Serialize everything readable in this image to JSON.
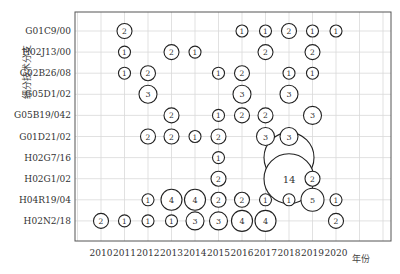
{
  "chart_data": {
    "type": "bubble",
    "title": "",
    "xlabel": "年份",
    "ylabel": "细分技术分支",
    "grid": true,
    "legend": null,
    "x_categories": [
      "2010",
      "2011",
      "2012",
      "2013",
      "2014",
      "2015",
      "2016",
      "2017",
      "2018",
      "2019",
      "2020"
    ],
    "y_categories": [
      "G01C9/00",
      "H02J13/00",
      "G02B26/08",
      "G05D1/02",
      "G05B19/042",
      "G01D21/02",
      "H02G7/16",
      "H02G1/02",
      "H04R19/04",
      "H02N2/18"
    ],
    "points": [
      {
        "row": "G01C9/00",
        "year": "2011",
        "value": 2
      },
      {
        "row": "G01C9/00",
        "year": "2016",
        "value": 1
      },
      {
        "row": "G01C9/00",
        "year": "2017",
        "value": 1
      },
      {
        "row": "G01C9/00",
        "year": "2018",
        "value": 2
      },
      {
        "row": "G01C9/00",
        "year": "2019",
        "value": 1
      },
      {
        "row": "G01C9/00",
        "year": "2020",
        "value": 1
      },
      {
        "row": "H02J13/00",
        "year": "2011",
        "value": 1
      },
      {
        "row": "H02J13/00",
        "year": "2013",
        "value": 2
      },
      {
        "row": "H02J13/00",
        "year": "2014",
        "value": 1
      },
      {
        "row": "H02J13/00",
        "year": "2017",
        "value": 2
      },
      {
        "row": "H02J13/00",
        "year": "2019",
        "value": 2
      },
      {
        "row": "G02B26/08",
        "year": "2011",
        "value": 1
      },
      {
        "row": "G02B26/08",
        "year": "2012",
        "value": 2
      },
      {
        "row": "G02B26/08",
        "year": "2015",
        "value": 1
      },
      {
        "row": "G02B26/08",
        "year": "2016",
        "value": 2
      },
      {
        "row": "G02B26/08",
        "year": "2018",
        "value": 1
      },
      {
        "row": "G02B26/08",
        "year": "2019",
        "value": 1
      },
      {
        "row": "G05D1/02",
        "year": "2012",
        "value": 3
      },
      {
        "row": "G05D1/02",
        "year": "2016",
        "value": 3
      },
      {
        "row": "G05D1/02",
        "year": "2018",
        "value": 3
      },
      {
        "row": "G05B19/042",
        "year": "2013",
        "value": 2
      },
      {
        "row": "G05B19/042",
        "year": "2015",
        "value": 1
      },
      {
        "row": "G05B19/042",
        "year": "2016",
        "value": 2
      },
      {
        "row": "G05B19/042",
        "year": "2017",
        "value": 2
      },
      {
        "row": "G05B19/042",
        "year": "2019",
        "value": 3
      },
      {
        "row": "G01D21/02",
        "year": "2012",
        "value": 2
      },
      {
        "row": "G01D21/02",
        "year": "2013",
        "value": 2
      },
      {
        "row": "G01D21/02",
        "year": "2014",
        "value": 1
      },
      {
        "row": "G01D21/02",
        "year": "2015",
        "value": 2
      },
      {
        "row": "G01D21/02",
        "year": "2017",
        "value": 3
      },
      {
        "row": "G01D21/02",
        "year": "2018",
        "value": 3
      },
      {
        "row": "H02G7/16",
        "year": "2015",
        "value": 1
      },
      {
        "row": "H02G7/16",
        "year": "2018",
        "value": 14
      },
      {
        "row": "H02G1/02",
        "year": "2015",
        "value": 2
      },
      {
        "row": "H02G1/02",
        "year": "2018",
        "value": 14
      },
      {
        "row": "H02G1/02",
        "year": "2019",
        "value": 2
      },
      {
        "row": "H04R19/04",
        "year": "2012",
        "value": 1
      },
      {
        "row": "H04R19/04",
        "year": "2013",
        "value": 4
      },
      {
        "row": "H04R19/04",
        "year": "2014",
        "value": 4
      },
      {
        "row": "H04R19/04",
        "year": "2015",
        "value": 2
      },
      {
        "row": "H04R19/04",
        "year": "2016",
        "value": 2
      },
      {
        "row": "H04R19/04",
        "year": "2017",
        "value": 1
      },
      {
        "row": "H04R19/04",
        "year": "2018",
        "value": 1
      },
      {
        "row": "H04R19/04",
        "year": "2019",
        "value": 5
      },
      {
        "row": "H04R19/04",
        "year": "2020",
        "value": 1
      },
      {
        "row": "H02N2/18",
        "year": "2010",
        "value": 2
      },
      {
        "row": "H02N2/18",
        "year": "2011",
        "value": 1
      },
      {
        "row": "H02N2/18",
        "year": "2012",
        "value": 1
      },
      {
        "row": "H02N2/18",
        "year": "2013",
        "value": 1
      },
      {
        "row": "H02N2/18",
        "year": "2014",
        "value": 3
      },
      {
        "row": "H02N2/18",
        "year": "2015",
        "value": 3
      },
      {
        "row": "H02N2/18",
        "year": "2016",
        "value": 4
      },
      {
        "row": "H02N2/18",
        "year": "2017",
        "value": 4
      },
      {
        "row": "H02N2/18",
        "year": "2020",
        "value": 2
      }
    ]
  },
  "layout": {
    "plot_left": 75,
    "plot_right": 391,
    "plot_top": 12,
    "plot_bottom": 241,
    "x_first": 101,
    "x_step": 23.5,
    "y_first": 31,
    "y_step": 21.1
  }
}
